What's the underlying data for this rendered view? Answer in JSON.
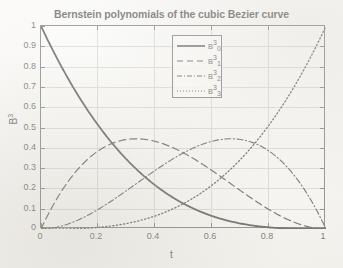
{
  "chart_data": {
    "type": "line",
    "title": "Bernstein polynomials of the cubic Bezier curve",
    "xlabel": "t",
    "ylabel": "B³",
    "xlim": [
      0,
      1
    ],
    "ylim": [
      0,
      1
    ],
    "grid": true,
    "legend_position": "upper center",
    "x_ticks": [
      "0",
      "0.2",
      "0.4",
      "0.6",
      "0.8",
      "1"
    ],
    "x_tick_values": [
      0,
      0.2,
      0.4,
      0.6,
      0.8,
      1
    ],
    "y_ticks": [
      "0",
      "0.1",
      "0.2",
      "0.3",
      "0.4",
      "0.5",
      "0.6",
      "0.7",
      "0.8",
      "0.9",
      "1"
    ],
    "y_tick_values": [
      0,
      0.1,
      0.2,
      0.3,
      0.4,
      0.5,
      0.6,
      0.7,
      0.8,
      0.9,
      1
    ],
    "x": [
      0,
      0.05,
      0.1,
      0.15,
      0.2,
      0.25,
      0.3,
      0.3333,
      0.35,
      0.4,
      0.45,
      0.5,
      0.55,
      0.6,
      0.65,
      0.6667,
      0.7,
      0.75,
      0.8,
      0.85,
      0.9,
      0.95,
      1
    ],
    "series": [
      {
        "name": "B₀³",
        "formula": "(1-t)^3",
        "style": "solid",
        "color": "#111111",
        "values": [
          1,
          0.857,
          0.729,
          0.614,
          0.512,
          0.422,
          0.343,
          0.296,
          0.275,
          0.216,
          0.166,
          0.125,
          0.091,
          0.064,
          0.043,
          0.037,
          0.027,
          0.016,
          0.008,
          0.003,
          0.001,
          0.0,
          0
        ]
      },
      {
        "name": "B₁³",
        "formula": "3t(1-t)^2",
        "style": "dashed",
        "color": "#1a1a1a",
        "peak": {
          "t": 0.3333,
          "value": 0.4444
        },
        "values": [
          0,
          0.135,
          0.243,
          0.325,
          0.384,
          0.422,
          0.441,
          0.444,
          0.444,
          0.432,
          0.408,
          0.375,
          0.334,
          0.288,
          0.239,
          0.222,
          0.189,
          0.141,
          0.096,
          0.057,
          0.027,
          0.007,
          0
        ]
      },
      {
        "name": "B₂³",
        "formula": "3t^2(1-t)",
        "style": "dashdot",
        "color": "#1a1a1a",
        "peak": {
          "t": 0.6667,
          "value": 0.4444
        },
        "values": [
          0,
          0.007,
          0.027,
          0.057,
          0.096,
          0.141,
          0.189,
          0.222,
          0.239,
          0.288,
          0.334,
          0.375,
          0.408,
          0.432,
          0.444,
          0.444,
          0.441,
          0.422,
          0.384,
          0.325,
          0.243,
          0.135,
          0
        ]
      },
      {
        "name": "B₃³",
        "formula": "t^3",
        "style": "dotted",
        "color": "#1a1a1a",
        "values": [
          0,
          0.0,
          0.001,
          0.003,
          0.008,
          0.016,
          0.027,
          0.037,
          0.043,
          0.064,
          0.091,
          0.125,
          0.166,
          0.216,
          0.275,
          0.296,
          0.343,
          0.422,
          0.512,
          0.614,
          0.729,
          0.857,
          1
        ]
      }
    ]
  },
  "legend": {
    "entries": [
      {
        "base": "B",
        "sub": "0",
        "sup": "3",
        "style": "solid"
      },
      {
        "base": "B",
        "sub": "1",
        "sup": "3",
        "style": "dashed"
      },
      {
        "base": "B",
        "sub": "2",
        "sup": "3",
        "style": "dashdot"
      },
      {
        "base": "B",
        "sub": "3",
        "sup": "3",
        "style": "dotted"
      }
    ]
  },
  "axis_titles": {
    "x": "t",
    "y_base": "B",
    "y_sup": "3"
  }
}
